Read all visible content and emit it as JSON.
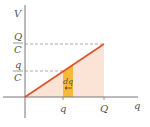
{
  "diagram": {
    "type": "V-q graph (capacitor charging energy)",
    "axes": {
      "y_label": "V",
      "x_label": "q"
    },
    "y_ticks": [
      {
        "num": "Q",
        "den": "C"
      },
      {
        "num": "q",
        "den": "C"
      }
    ],
    "x_ticks": [
      "q",
      "Q"
    ],
    "strip_label": "dq",
    "colors": {
      "line": "#d9542b",
      "fill": "#fbe3d6",
      "strip": "#f6b93a",
      "axis": "#777777",
      "dash": "#888888"
    }
  }
}
